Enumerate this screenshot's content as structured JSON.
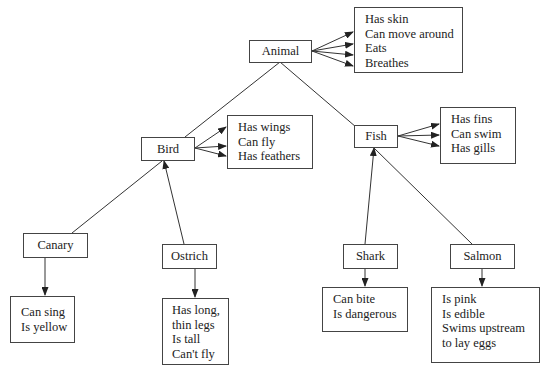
{
  "diagram": {
    "type": "semantic-network",
    "nodes": {
      "animal": {
        "label": "Animal",
        "properties": [
          "Has skin",
          "Can move around",
          "Eats",
          "Breathes"
        ]
      },
      "bird": {
        "label": "Bird",
        "properties": [
          "Has wings",
          "Can fly",
          "Has feathers"
        ]
      },
      "fish": {
        "label": "Fish",
        "properties": [
          "Has fins",
          "Can swim",
          "Has gills"
        ]
      },
      "canary": {
        "label": "Canary",
        "properties": [
          "Can sing",
          "Is yellow"
        ]
      },
      "ostrich": {
        "label": "Ostrich",
        "properties": [
          "Has long,",
          "thin legs",
          "Is tall",
          "Can't fly"
        ]
      },
      "shark": {
        "label": "Shark",
        "properties": [
          "Can bite",
          "Is dangerous"
        ]
      },
      "salmon": {
        "label": "Salmon",
        "properties": [
          "Is pink",
          "Is edible",
          "Swims upstream",
          "to lay eggs"
        ]
      }
    },
    "edges": [
      {
        "from": "bird",
        "to": "animal",
        "type": "is-a"
      },
      {
        "from": "fish",
        "to": "animal",
        "type": "is-a"
      },
      {
        "from": "canary",
        "to": "bird",
        "type": "is-a"
      },
      {
        "from": "ostrich",
        "to": "bird",
        "type": "is-a"
      },
      {
        "from": "shark",
        "to": "fish",
        "type": "is-a"
      },
      {
        "from": "salmon",
        "to": "fish",
        "type": "is-a"
      }
    ],
    "colors": {
      "line": "#333333",
      "border": "#444444",
      "text": "#222222",
      "background": "#ffffff"
    }
  }
}
